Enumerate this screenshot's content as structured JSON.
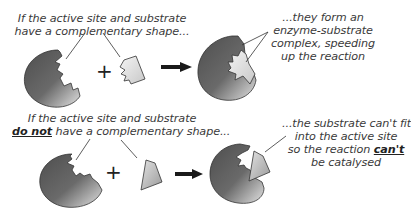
{
  "top_clipped_text": "...",
  "row1": {
    "left_caption_line1": "If the active site and substrate",
    "left_caption_line2": "have a complementary shape...",
    "right_caption_line1": "...they form an",
    "right_caption_line2": "enzyme-substrate",
    "right_caption_line3": "complex, speeding",
    "right_caption_line4": "up the reaction",
    "plus_sign": "+"
  },
  "row2": {
    "left_caption_line1": "If the active site and substrate",
    "left_caption_line2_emph": "do not",
    "left_caption_line2_rest": " have a complementary shape...",
    "right_caption_line1": "...the substrate can't fit",
    "right_caption_line2": "into the active site",
    "right_caption_line3_pre": "so the reaction ",
    "right_caption_line3_emph": "can't",
    "right_caption_line4": "be catalysed",
    "plus_sign": "+"
  },
  "colors": {
    "enzyme_dark": "#5a5a5a",
    "enzyme_light": "#d8d8d8",
    "substrate_fill": "#e6e6e6",
    "outline": "#333333",
    "arrow": "#1a1a1a"
  }
}
